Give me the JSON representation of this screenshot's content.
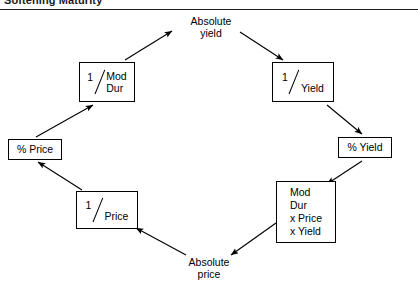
{
  "header": {
    "running_title": "Softening Maturity",
    "rule_visible": true
  },
  "diagram": {
    "type": "cycle-flow",
    "direction": "clockwise",
    "nodes": [
      {
        "id": "pct-price",
        "label": "% Price",
        "boxed": true,
        "style": "text"
      },
      {
        "id": "inv-moddur",
        "label": "1 / Mod Dur",
        "numerator": "1",
        "denominator": "Mod\nDur",
        "boxed": true,
        "style": "fraction"
      },
      {
        "id": "abs-yield",
        "label": "Absolute\nyield",
        "boxed": false,
        "style": "text"
      },
      {
        "id": "inv-yield",
        "label": "1 / Yield",
        "numerator": "1",
        "denominator": "Yield",
        "boxed": true,
        "style": "fraction"
      },
      {
        "id": "pct-yield",
        "label": "% Yield",
        "boxed": true,
        "style": "text"
      },
      {
        "id": "modfull",
        "label": "Mod\nDur\nx Price\nx Yield",
        "boxed": true,
        "style": "text"
      },
      {
        "id": "abs-price",
        "label": "Absolute\nprice",
        "boxed": false,
        "style": "text"
      },
      {
        "id": "inv-price",
        "label": "1 / Price",
        "numerator": "1",
        "denominator": "Price",
        "boxed": true,
        "style": "fraction"
      }
    ],
    "edges": [
      {
        "from": "pct-price",
        "to": "inv-moddur",
        "arrow": "end"
      },
      {
        "from": "inv-moddur",
        "to": "abs-yield",
        "arrow": "end"
      },
      {
        "from": "abs-yield",
        "to": "inv-yield",
        "arrow": "end"
      },
      {
        "from": "inv-yield",
        "to": "pct-yield",
        "arrow": "end"
      },
      {
        "from": "pct-yield",
        "to": "modfull",
        "arrow": "end"
      },
      {
        "from": "modfull",
        "to": "abs-price",
        "arrow": "end"
      },
      {
        "from": "abs-price",
        "to": "inv-price",
        "arrow": "end"
      },
      {
        "from": "inv-price",
        "to": "pct-price",
        "arrow": "end"
      }
    ],
    "colors": {
      "stroke": "#000000",
      "text": "#000000",
      "background": "#ffffff"
    }
  }
}
